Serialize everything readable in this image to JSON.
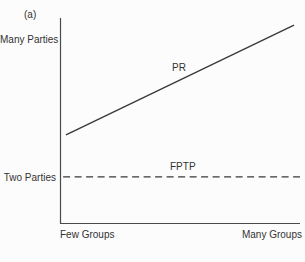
{
  "chart_data": {
    "type": "line",
    "panel_label": "(a)",
    "title": "",
    "x_axis": {
      "left_label": "Few Groups",
      "right_label": "Many Groups",
      "scale": "qualitative",
      "range": [
        0,
        1
      ]
    },
    "y_axis": {
      "top_label": "Many Parties",
      "bottom_label": "Two Parties",
      "scale": "qualitative",
      "range": [
        0,
        1
      ]
    },
    "axis_color": "#4a4a4a",
    "line_color": "#383838",
    "text_color": "#333333",
    "grid": false,
    "legend": "inline-labels",
    "series": [
      {
        "name": "PR",
        "style": "solid",
        "points": [
          [
            0.025,
            0.43
          ],
          [
            0.975,
            0.965
          ]
        ]
      },
      {
        "name": "FPTP",
        "style": "dashed",
        "points": [
          [
            0.013,
            0.225
          ],
          [
            1.0,
            0.225
          ]
        ]
      }
    ],
    "annotations": [
      {
        "text": "PR",
        "attached_to": "PR"
      },
      {
        "text": "FPTP",
        "attached_to": "FPTP"
      }
    ]
  }
}
